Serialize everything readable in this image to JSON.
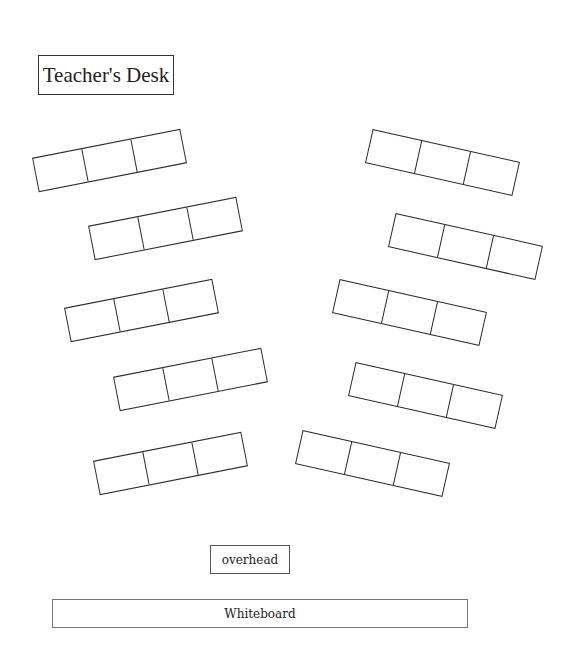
{
  "teacher_desk": {
    "label": "Teacher's Desk",
    "x": 38,
    "y": 55,
    "w": 136,
    "h": 40
  },
  "overhead": {
    "label": "overhead",
    "x": 210,
    "y": 545,
    "w": 80,
    "h": 29
  },
  "whiteboard": {
    "label": "Whiteboard",
    "x": 52,
    "y": 599,
    "w": 416,
    "h": 29
  },
  "desk_groups": {
    "seats_per_group": 3,
    "group_width": 151,
    "group_height": 35,
    "line_color": "#2a2a2a",
    "left": [
      {
        "id": "L1",
        "cx": 109,
        "cy": 160,
        "angle": -11.1
      },
      {
        "id": "L2",
        "cx": 165,
        "cy": 228,
        "angle": -11.1
      },
      {
        "id": "L3",
        "cx": 141,
        "cy": 310,
        "angle": -11.1
      },
      {
        "id": "L4",
        "cx": 190,
        "cy": 379,
        "angle": -11.1
      },
      {
        "id": "L5",
        "cx": 170,
        "cy": 463,
        "angle": -11.1
      }
    ],
    "right": [
      {
        "id": "R1",
        "cx": 442,
        "cy": 162,
        "angle": 12.6
      },
      {
        "id": "R2",
        "cx": 465,
        "cy": 246,
        "angle": 12.6
      },
      {
        "id": "R3",
        "cx": 409,
        "cy": 312,
        "angle": 12.6
      },
      {
        "id": "R4",
        "cx": 425,
        "cy": 395,
        "angle": 12.6
      },
      {
        "id": "R5",
        "cx": 372,
        "cy": 463,
        "angle": 12.6
      }
    ]
  }
}
